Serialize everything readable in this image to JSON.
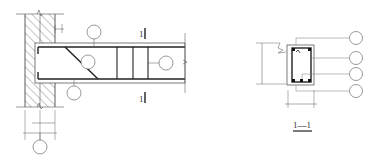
{
  "drawing": {
    "type": "reinforced concrete beam detail",
    "elevation": {
      "section_mark_top": "1",
      "section_mark_bottom": "1",
      "callout_circles": [
        "",
        "",
        "",
        "",
        ""
      ]
    },
    "section": {
      "title": "1—1",
      "callout_circles": [
        "",
        "",
        "",
        ""
      ]
    },
    "colors": {
      "line": "#333333",
      "thin_line": "#666666",
      "background": "#ffffff"
    }
  }
}
